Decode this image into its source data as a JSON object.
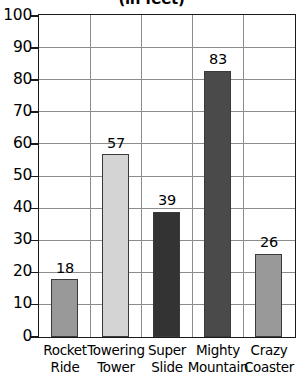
{
  "chart_data": {
    "type": "bar",
    "title": "(in feet)",
    "xlabel": "",
    "ylabel": "",
    "ylim": [
      0,
      100
    ],
    "ytick_step": 10,
    "grid": true,
    "legend": "none",
    "categories": [
      "Rocket Ride",
      "Towering Tower",
      "Super Slide",
      "Mighty Mountain",
      "Crazy Coaster"
    ],
    "category_lines": [
      [
        "Rocket",
        "Ride"
      ],
      [
        "Towering",
        "Tower"
      ],
      [
        "Super",
        "Slide"
      ],
      [
        "Mighty",
        "Mountain"
      ],
      [
        "Crazy",
        "Coaster"
      ]
    ],
    "values": [
      18,
      57,
      39,
      83,
      26
    ],
    "value_labels": [
      "18",
      "57",
      "39",
      "83",
      "26"
    ],
    "bar_colors": [
      "#999999",
      "#d4d4d4",
      "#333333",
      "#4a4a4a",
      "#999999"
    ],
    "yticks": [
      "100",
      "90",
      "80",
      "70",
      "60",
      "50",
      "40",
      "30",
      "20",
      "10",
      "0"
    ],
    "ytick_values": [
      100,
      90,
      80,
      70,
      60,
      50,
      40,
      30,
      20,
      10,
      0
    ]
  },
  "colors": {
    "axis": "#1a1a1a",
    "grid": "#8c8c8c",
    "background": "#ffffff",
    "text": "#000000"
  }
}
